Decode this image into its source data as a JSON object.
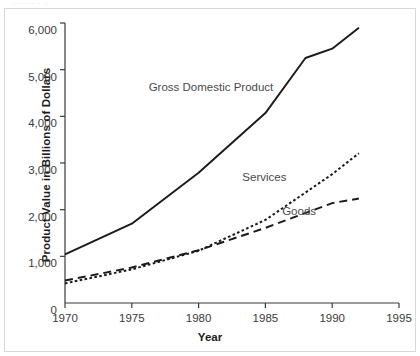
{
  "figure": {
    "top_cropped_text": "........  .  ..",
    "border_color": "#d8d8dc",
    "line_color": "#1a1a1a"
  },
  "chart_data": {
    "type": "line",
    "title": "",
    "xlabel": "Year",
    "ylabel": "Product Value in Billions of Dollars",
    "xlim": [
      1970,
      1995
    ],
    "ylim": [
      0,
      6000
    ],
    "xticks": [
      "1970",
      "1975",
      "1980",
      "1985",
      "1990",
      "1995"
    ],
    "xtick_values": [
      1970,
      1975,
      1980,
      1985,
      1990,
      1995
    ],
    "yticks": [
      "0",
      "1,000",
      "2,000",
      "3,000",
      "4,000",
      "5,000",
      "6,000"
    ],
    "ytick_values": [
      0,
      1000,
      2000,
      3000,
      4000,
      5000,
      6000
    ],
    "grid": false,
    "legend": "inline-annotations",
    "series": [
      {
        "name": "Gross Domestic Product",
        "style": "solid",
        "label_x": 1981.0,
        "label_y": 4620,
        "x": [
          1970,
          1975,
          1980,
          1985,
          1988,
          1990,
          1992
        ],
        "values": [
          1040,
          1700,
          2790,
          4070,
          5250,
          5450,
          5900
        ]
      },
      {
        "name": "Services",
        "style": "dotted",
        "label_x": 1985.0,
        "label_y": 2700,
        "x": [
          1970,
          1975,
          1980,
          1985,
          1990,
          1992
        ],
        "values": [
          420,
          720,
          1120,
          1780,
          2760,
          3210
        ]
      },
      {
        "name": "Goods",
        "style": "dashed",
        "label_x": 1987.6,
        "label_y": 1980,
        "x": [
          1970,
          1975,
          1980,
          1985,
          1990,
          1992
        ],
        "values": [
          480,
          760,
          1130,
          1610,
          2140,
          2240
        ]
      }
    ]
  }
}
